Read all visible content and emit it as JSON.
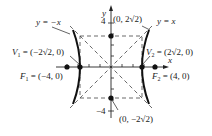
{
  "diagram": {
    "axes": {
      "x_label": "x",
      "y_label": "y",
      "y_tick_top": "4",
      "y_tick_bottom": "−4"
    },
    "asymptotes": [
      {
        "label": "y = −x"
      },
      {
        "label": "y = x"
      }
    ],
    "points": {
      "V1": {
        "name": "V",
        "sub": "1",
        "value": " = (−2√2, 0)"
      },
      "V2": {
        "name": "V",
        "sub": "2",
        "value": " = (2√2, 0)"
      },
      "F1": {
        "name": "F",
        "sub": "1",
        "value": " = (−4, 0)"
      },
      "F2": {
        "name": "F",
        "sub": "2",
        "value": " = (4, 0)"
      },
      "top": {
        "label": "(0, 2√2)"
      },
      "bottom": {
        "label": "(0, −2√2)"
      }
    }
  }
}
